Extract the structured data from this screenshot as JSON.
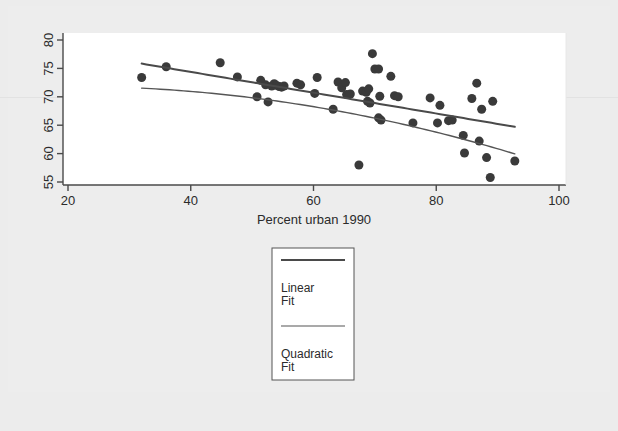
{
  "chart_data": {
    "type": "scatter",
    "title": "",
    "xlabel": "Percent urban 1990",
    "ylabel": "",
    "xlim": [
      20,
      100
    ],
    "ylim": [
      54,
      81
    ],
    "xticks": [
      20,
      40,
      60,
      80,
      100
    ],
    "yticks": [
      55,
      60,
      65,
      70,
      75,
      80
    ],
    "xtick_labels": [
      "20",
      "40",
      "60",
      "80",
      "100"
    ],
    "ytick_labels": [
      "55",
      "60",
      "65",
      "70",
      "75",
      "80"
    ],
    "grid": false,
    "legend_position": "below-plot-center",
    "marker": {
      "shape": "circle",
      "color": "#3a3a3a",
      "size": 9
    },
    "points": [
      [
        32.0,
        73.4
      ],
      [
        36.0,
        75.3
      ],
      [
        44.8,
        76.0
      ],
      [
        47.6,
        73.5
      ],
      [
        50.8,
        70.0
      ],
      [
        51.4,
        72.9
      ],
      [
        52.2,
        72.1
      ],
      [
        52.6,
        69.1
      ],
      [
        53.2,
        71.9
      ],
      [
        53.6,
        72.3
      ],
      [
        54.0,
        72.0
      ],
      [
        54.4,
        71.8
      ],
      [
        54.8,
        71.7
      ],
      [
        55.2,
        71.9
      ],
      [
        57.3,
        72.4
      ],
      [
        57.9,
        72.1
      ],
      [
        60.2,
        70.6
      ],
      [
        60.6,
        73.4
      ],
      [
        63.2,
        67.8
      ],
      [
        64.0,
        72.6
      ],
      [
        64.6,
        71.6
      ],
      [
        65.2,
        72.5
      ],
      [
        65.4,
        70.4
      ],
      [
        66.0,
        70.5
      ],
      [
        67.4,
        58.0
      ],
      [
        68.0,
        71.0
      ],
      [
        68.6,
        70.8
      ],
      [
        68.8,
        69.2
      ],
      [
        69.0,
        71.4
      ],
      [
        69.2,
        68.9
      ],
      [
        69.6,
        77.6
      ],
      [
        70.0,
        74.9
      ],
      [
        70.6,
        74.9
      ],
      [
        70.6,
        66.3
      ],
      [
        70.8,
        70.1
      ],
      [
        71.0,
        65.9
      ],
      [
        72.6,
        73.6
      ],
      [
        73.2,
        70.2
      ],
      [
        73.8,
        70.0
      ],
      [
        76.2,
        65.4
      ],
      [
        79.0,
        69.8
      ],
      [
        80.2,
        65.4
      ],
      [
        80.6,
        68.5
      ],
      [
        82.0,
        65.8
      ],
      [
        82.6,
        65.9
      ],
      [
        84.4,
        63.2
      ],
      [
        84.6,
        60.1
      ],
      [
        85.8,
        69.7
      ],
      [
        86.6,
        72.4
      ],
      [
        87.0,
        62.2
      ],
      [
        87.4,
        67.8
      ],
      [
        88.2,
        59.3
      ],
      [
        88.8,
        55.8
      ],
      [
        89.2,
        69.2
      ],
      [
        92.8,
        58.7
      ]
    ],
    "fits": [
      {
        "name": "Linear Fit",
        "kind": "linear",
        "color": "#4a4a4a",
        "width": 2.0,
        "x_range": [
          32.0,
          92.8
        ],
        "coefficients": {
          "intercept": 81.7,
          "slope": -0.183
        }
      },
      {
        "name": "Quadratic Fit",
        "kind": "quadratic",
        "color": "#555555",
        "width": 1.4,
        "x_range": [
          32.0,
          92.8
        ],
        "coefficients": {
          "a": 70.93,
          "b": 0.0905,
          "c": -0.00225
        }
      }
    ]
  },
  "axis": {
    "x_title": "Percent urban 1990"
  },
  "legend": {
    "entries": [
      {
        "label_line1": "Linear",
        "label_line2": "Fit",
        "swatch": "thick-line-swatch"
      },
      {
        "label_line1": "Quadratic",
        "label_line2": "Fit",
        "swatch": "thin-line-swatch"
      }
    ]
  },
  "colors": {
    "page_background": "#ececec",
    "plot_background": "#ffffff",
    "axis": "#4a4a4a",
    "marker": "#3a3a3a",
    "linear_fit": "#4a4a4a",
    "quadratic_fit": "#555555",
    "text": "#2b2b2b"
  }
}
